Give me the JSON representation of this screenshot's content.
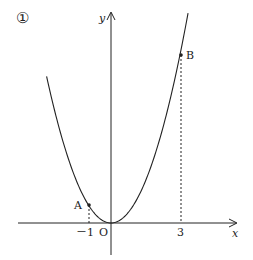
{
  "figure": {
    "marker": "①",
    "axes": {
      "x_label": "x",
      "y_label": "y",
      "origin_label": "O"
    },
    "curve": "y = a x^2 (parabola through origin)",
    "ticks": {
      "neg_one": "－1",
      "three": "3"
    },
    "points": [
      {
        "name": "A",
        "x": -1
      },
      {
        "name": "B",
        "x": 3
      }
    ],
    "colors": {
      "ink": "#222222",
      "background": "#ffffff"
    }
  }
}
